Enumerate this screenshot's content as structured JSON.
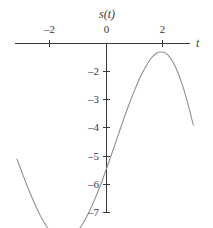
{
  "figure": {
    "width": 213,
    "height": 228,
    "background": "#ffffff",
    "curve_color": "#8c8c8c",
    "axis_color": "#3a3a3a"
  },
  "labels": {
    "y_axis_name": "s(t)",
    "x_axis_name": "t",
    "origin": "0"
  },
  "chart_data": {
    "type": "line",
    "title": "",
    "subtitle": "",
    "xlabel": "t",
    "ylabel": "s(t)",
    "xlim": [
      -3.25,
      3.3
    ],
    "ylim": [
      -7.35,
      0.6
    ],
    "grid": false,
    "legend": null,
    "annotations": [],
    "x_ticks": [
      {
        "value": -2,
        "label": "–2"
      },
      {
        "value": 0,
        "label": "0"
      },
      {
        "value": 2,
        "label": "2"
      }
    ],
    "y_ticks": [
      {
        "value": -2,
        "label": "–2"
      },
      {
        "value": -3,
        "label": "–3"
      },
      {
        "value": -4,
        "label": "–4"
      },
      {
        "value": -5,
        "label": "–5"
      },
      {
        "value": -6,
        "label": "–6"
      },
      {
        "value": -7,
        "label": "–7"
      }
    ],
    "series": [
      {
        "name": "s(t)",
        "x": [
          -3.2,
          -3.0,
          -2.8,
          -2.6,
          -2.4,
          -2.2,
          -2.0,
          -1.8,
          -1.6,
          -1.4,
          -1.2,
          -1.0,
          -0.8,
          -0.6,
          -0.4,
          -0.2,
          0.0,
          0.2,
          0.4,
          0.6,
          0.8,
          1.0,
          1.2,
          1.4,
          1.6,
          1.75,
          1.9,
          2.1,
          2.3,
          2.5,
          2.7,
          2.9,
          3.1
        ],
        "y": [
          -4.1,
          -4.63,
          -5.14,
          -5.61,
          -6.04,
          -6.4,
          -6.68,
          -6.86,
          -6.95,
          -6.94,
          -6.83,
          -6.62,
          -6.32,
          -5.94,
          -5.49,
          -4.99,
          -4.45,
          -3.88,
          -3.3,
          -2.73,
          -2.18,
          -1.67,
          -1.21,
          -0.83,
          -0.52,
          -0.38,
          -0.31,
          -0.34,
          -0.54,
          -0.92,
          -1.45,
          -2.12,
          -2.9
        ]
      }
    ]
  }
}
